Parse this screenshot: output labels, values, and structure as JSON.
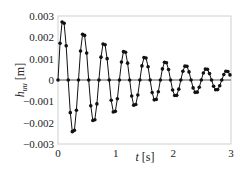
{
  "chart_data": {
    "type": "line",
    "title": "",
    "xlabel": "t [s]",
    "ylabel": "h_uu [m]",
    "ylabel_main": "h",
    "ylabel_sub": "uu",
    "ylabel_unit": "[m]",
    "xlabel_var": "t",
    "xlabel_unit": "[s]",
    "xlim": [
      0,
      3
    ],
    "ylim": [
      -0.003,
      0.003
    ],
    "xticks": [
      0,
      1,
      2,
      3
    ],
    "xtick_labels": [
      "0",
      "1",
      "2",
      "3"
    ],
    "yticks": [
      0.003,
      0.002,
      0.001,
      0,
      -0.001,
      -0.002,
      -0.003
    ],
    "ytick_labels": [
      "0.003",
      "0.002",
      "0.001",
      "0",
      "-0.001",
      "-0.002",
      "-0.003"
    ],
    "grid": false,
    "legend": null,
    "zero_line": true,
    "series": [
      {
        "name": "h_uu",
        "marker": "circle",
        "color": "#111111",
        "x": [
          0,
          0.0355,
          0.071,
          0.1065,
          0.142,
          0.1775,
          0.213,
          0.2485,
          0.284,
          0.3195,
          0.355,
          0.3905,
          0.426,
          0.4615,
          0.497,
          0.5325,
          0.568,
          0.6035,
          0.639,
          0.6745,
          0.71,
          0.7455,
          0.781,
          0.8165,
          0.852,
          0.8875,
          0.923,
          0.9585,
          0.994,
          1.0295,
          1.065,
          1.1005,
          1.136,
          1.1715,
          1.207,
          1.2425,
          1.278,
          1.3135,
          1.349,
          1.3845,
          1.42,
          1.4555,
          1.491,
          1.5265,
          1.562,
          1.5975,
          1.633,
          1.6685,
          1.704,
          1.7395,
          1.775,
          1.8105,
          1.846,
          1.8815,
          1.917,
          1.9525,
          1.988,
          2.0235,
          2.059,
          2.0945,
          2.13,
          2.1655,
          2.201,
          2.2365,
          2.272,
          2.3075,
          2.343,
          2.3785,
          2.414,
          2.4495,
          2.485,
          2.5205,
          2.556,
          2.5915,
          2.627,
          2.6625,
          2.698,
          2.7335,
          2.769,
          2.8045,
          2.84,
          2.8755,
          2.911,
          2.9465,
          2.982
        ],
        "y": [
          0,
          0.00172,
          0.00272,
          0.00266,
          0.0016,
          0,
          -0.00153,
          -0.00242,
          -0.00236,
          -0.00142,
          0,
          0.00136,
          0.00214,
          0.00209,
          0.00126,
          0,
          -0.00121,
          -0.0019,
          -0.00186,
          -0.00112,
          0,
          0.00107,
          0.00169,
          0.00165,
          0.001,
          0,
          -0.00095,
          -0.0015,
          -0.00147,
          -0.00088,
          0,
          0.00084,
          0.00133,
          0.0013,
          0.00079,
          0,
          -0.00075,
          -0.00118,
          -0.00115,
          -0.0007,
          0,
          0.00066,
          0.00105,
          0.00103,
          0.00062,
          0,
          -0.00059,
          -0.00093,
          -0.00091,
          -0.00055,
          0,
          0.00052,
          0.00083,
          0.00081,
          0.00049,
          0,
          -0.00047,
          -0.00073,
          -0.00072,
          -0.00043,
          0,
          0.00041,
          0.00065,
          0.00064,
          0.00038,
          0,
          -0.00037,
          -0.00058,
          -0.00057,
          -0.00034,
          0,
          0.00033,
          0.00051,
          0.0005,
          0.0003,
          0,
          -0.00029,
          -0.00046,
          -0.00045,
          -0.00027,
          0,
          0.00026,
          0.00041,
          0.0004,
          0.00024
        ]
      }
    ]
  }
}
